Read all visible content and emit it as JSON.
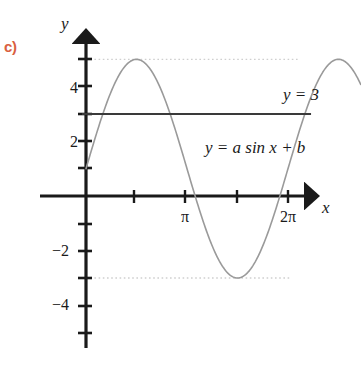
{
  "part_label": "c)",
  "colors": {
    "part_label": "#d9603f",
    "axis": "#1a1a1a",
    "curve": "#9a9a9a",
    "constant_line": "#3a3a3a",
    "dotted_guide": "#cfcfcf",
    "background": "#ffffff"
  },
  "axes": {
    "y_axis_name": "y",
    "x_axis_name": "x",
    "y_tick_labels": [
      "4",
      "2",
      "−2",
      "−4"
    ],
    "x_tick_labels": [
      "π",
      "2π"
    ]
  },
  "labels": {
    "constant_line": "y = 3",
    "sine_curve": "y = a sin x + b"
  },
  "chart_data": {
    "type": "line",
    "title": "",
    "xlabel": "x",
    "ylabel": "y",
    "xlim": [
      -0.45,
      7.25
    ],
    "ylim": [
      -5.3,
      5.6
    ],
    "grid": false,
    "legend": "none",
    "x_ticks": [
      1.5707963,
      3.1415927,
      4.712389,
      6.2831853
    ],
    "x_tick_labels": [
      "",
      "π",
      "",
      "2π"
    ],
    "y_ticks": [
      -5,
      -4,
      -3,
      -2,
      -1,
      1,
      2,
      3,
      4,
      5
    ],
    "y_tick_labels": [
      "",
      "−4",
      "",
      "−2",
      "",
      "",
      "2",
      "",
      "4",
      ""
    ],
    "series": [
      {
        "name": "y = a sin x + b",
        "type": "line",
        "equation": "y = 4*sin(x) + 1",
        "amplitude": 4,
        "vertical_shift": 1,
        "color": "#9a9a9a",
        "x_range": [
          0,
          6.2831853
        ],
        "maximum": {
          "x": 1.5707963,
          "y": 5
        },
        "minimum": {
          "x": 4.712389,
          "y": -3
        },
        "y_intercept": 1
      },
      {
        "name": "y = 3",
        "type": "horizontal-line",
        "value": 3,
        "color": "#3a3a3a",
        "x_range": [
          0,
          7.0
        ]
      }
    ],
    "guides": [
      {
        "type": "dotted-horizontal",
        "value": 5,
        "label": "maximum"
      },
      {
        "type": "dotted-horizontal",
        "value": -3,
        "label": "minimum"
      }
    ],
    "annotations": [
      {
        "text": "y = 3",
        "x": 6.3,
        "y": 3.6
      },
      {
        "text": "y = a sin x + b",
        "x": 4.0,
        "y": 1.8
      },
      {
        "text": "c)",
        "x": -0.9,
        "y": 4.6
      }
    ]
  }
}
